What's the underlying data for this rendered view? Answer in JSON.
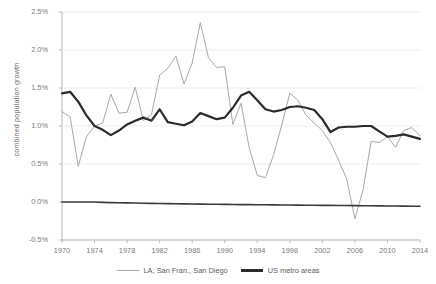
{
  "title_partial": "",
  "axes": {
    "ylabel": "combined population growth",
    "yticks": [
      "2.5%",
      "2.0%",
      "1.5%",
      "1.0%",
      "0.5%",
      "0.0%",
      "-0.5%"
    ],
    "xticks": [
      "1970",
      "1974",
      "1978",
      "1982",
      "1986",
      "1990",
      "1994",
      "1998",
      "2002",
      "2006",
      "2010",
      "2014"
    ]
  },
  "legend": {
    "items": [
      {
        "label": "LA, San Fran., San Diego",
        "color": "#a8a8a8",
        "style": "thin"
      },
      {
        "label": "US metro areas",
        "color": "#2b2b2b",
        "style": "thick"
      }
    ]
  },
  "colors": {
    "metro_line": "#a8a8a8",
    "us_line": "#2b2b2b",
    "grid": "#ededed",
    "axis": "#b9b9b9",
    "tick_text": "#7a7a7a"
  },
  "chart_data": {
    "type": "line",
    "title": "",
    "xlabel": "",
    "ylabel": "combined population growth",
    "xlim": [
      1970,
      2014
    ],
    "ylim": [
      -0.5,
      2.5
    ],
    "ytick_values": [
      2.5,
      2.0,
      1.5,
      1.0,
      0.5,
      0.0,
      -0.5
    ],
    "xtick_values": [
      1970,
      1974,
      1978,
      1982,
      1986,
      1990,
      1994,
      1998,
      2002,
      2006,
      2010,
      2014
    ],
    "grid": "horizontal",
    "legend_position": "bottom",
    "units": "percent",
    "x": [
      1970,
      1971,
      1972,
      1973,
      1974,
      1975,
      1976,
      1977,
      1978,
      1979,
      1980,
      1981,
      1982,
      1983,
      1984,
      1985,
      1986,
      1987,
      1988,
      1989,
      1990,
      1991,
      1992,
      1993,
      1994,
      1995,
      1996,
      1997,
      1998,
      1999,
      2000,
      2001,
      2002,
      2003,
      2004,
      2005,
      2006,
      2007,
      2008,
      2009,
      2010,
      2011,
      2012,
      2013,
      2014
    ],
    "series": [
      {
        "name": "LA, San Fran., San Diego",
        "color": "#a8a8a8",
        "width": 1.0,
        "values": [
          1.19,
          1.12,
          0.47,
          0.86,
          1.0,
          1.04,
          1.42,
          1.17,
          1.18,
          1.51,
          1.07,
          1.15,
          1.67,
          1.76,
          1.92,
          1.55,
          1.83,
          2.36,
          1.9,
          1.77,
          1.78,
          1.02,
          1.3,
          0.72,
          0.35,
          0.32,
          0.62,
          1.01,
          1.43,
          1.34,
          1.14,
          1.04,
          0.94,
          0.78,
          0.55,
          0.3,
          -0.22,
          0.16,
          0.8,
          0.78,
          0.86,
          0.72,
          0.94,
          0.98,
          0.87
        ]
      },
      {
        "name": "US metro areas",
        "color": "#2b2b2b",
        "width": 2.2,
        "values": [
          1.43,
          1.45,
          1.32,
          1.14,
          1.0,
          0.95,
          0.88,
          0.94,
          1.02,
          1.07,
          1.11,
          1.07,
          1.22,
          1.05,
          1.03,
          1.01,
          1.06,
          1.17,
          1.13,
          1.09,
          1.11,
          1.24,
          1.4,
          1.45,
          1.34,
          1.22,
          1.19,
          1.21,
          1.25,
          1.26,
          1.24,
          1.21,
          1.09,
          0.92,
          0.98,
          0.99,
          0.99,
          1.0,
          1.0,
          0.93,
          0.86,
          0.87,
          0.89,
          0.86,
          0.83
        ]
      },
      {
        "name": "zero-baseline",
        "color": "#3a3a3a",
        "width": 1.6,
        "is_baseline": true,
        "values": [
          0.0,
          0.0,
          0.0,
          0.0,
          0.0,
          -0.005,
          -0.008,
          -0.01,
          -0.012,
          -0.014,
          -0.016,
          -0.018,
          -0.02,
          -0.022,
          -0.023,
          -0.025,
          -0.026,
          -0.028,
          -0.029,
          -0.03,
          -0.031,
          -0.032,
          -0.034,
          -0.035,
          -0.036,
          -0.037,
          -0.038,
          -0.039,
          -0.04,
          -0.041,
          -0.042,
          -0.043,
          -0.044,
          -0.045,
          -0.046,
          -0.047,
          -0.048,
          -0.049,
          -0.05,
          -0.051,
          -0.052,
          -0.053,
          -0.054,
          -0.055,
          -0.056
        ]
      }
    ]
  }
}
